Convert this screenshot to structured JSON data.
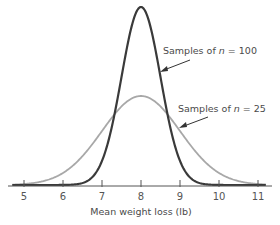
{
  "chart_data": {
    "type": "line",
    "title": "",
    "xlabel": "Mean weight loss (lb)",
    "ylabel": "",
    "x_ticks": [
      5,
      6,
      7,
      8,
      9,
      10,
      11
    ],
    "xlim": [
      4.5,
      11.3
    ],
    "grid": false,
    "legend": "annotations",
    "series": [
      {
        "name": "Samples of n = 100",
        "label_prefix": "Samples of ",
        "label_var": "n",
        "label_suffix": " = 100",
        "mean": 8,
        "sd": 0.5,
        "peak_relative_height": 1.0,
        "color": "#3a3a3a",
        "stroke_width": 2.2
      },
      {
        "name": "Samples of n = 25",
        "label_prefix": "Samples of ",
        "label_var": "n",
        "label_suffix": " = 25",
        "mean": 8,
        "sd": 1.0,
        "peak_relative_height": 0.5,
        "color": "#a8a8a8",
        "stroke_width": 1.8
      }
    ]
  },
  "axis": {
    "label": "Mean weight loss (lb)"
  },
  "annotations": {
    "n100": {
      "prefix": "Samples of ",
      "var": "n",
      "suffix": " = 100"
    },
    "n25": {
      "prefix": "Samples of ",
      "var": "n",
      "suffix": " = 25"
    }
  }
}
